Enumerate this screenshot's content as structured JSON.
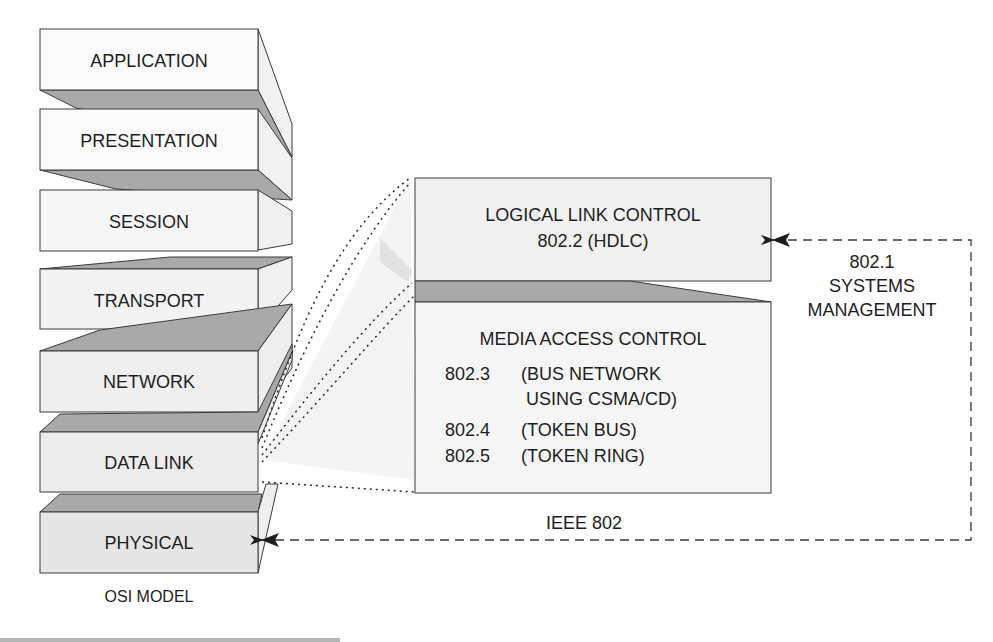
{
  "osi_model": {
    "caption": "OSI MODEL",
    "layers": [
      {
        "name": "APPLICATION"
      },
      {
        "name": "PRESENTATION"
      },
      {
        "name": "SESSION"
      },
      {
        "name": "TRANSPORT"
      },
      {
        "name": "NETWORK"
      },
      {
        "name": "DATA LINK"
      },
      {
        "name": "PHYSICAL"
      }
    ]
  },
  "ieee802": {
    "caption": "IEEE 802",
    "llc": {
      "title": "LOGICAL LINK CONTROL",
      "subtitle": "802.2 (HDLC)"
    },
    "mac": {
      "title": "MEDIA ACCESS CONTROL",
      "entries": [
        {
          "code": "802.3",
          "desc_line1": "(BUS NETWORK",
          "desc_line2": "USING CSMA/CD)"
        },
        {
          "code": "802.4",
          "desc_line1": "(TOKEN BUS)"
        },
        {
          "code": "802.5",
          "desc_line1": "(TOKEN RING)"
        }
      ]
    },
    "systems_management": {
      "line1": "802.1",
      "line2": "SYSTEMS",
      "line3": "MANAGEMENT"
    }
  },
  "colors": {
    "face_light": "#f7f7f7",
    "face_mid": "#ececec",
    "shade": "#a9a9a9",
    "side": "#eeeeee",
    "stroke": "#3a3a3a",
    "footer_bar": "#b4b4b4"
  }
}
